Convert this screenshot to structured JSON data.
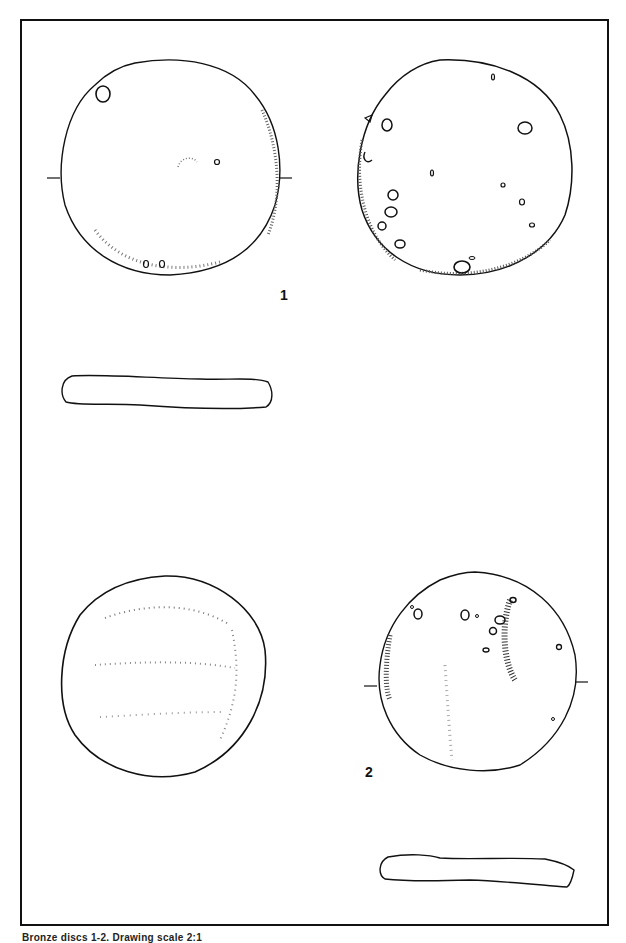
{
  "plate": {
    "figures": [
      {
        "number": "1",
        "views": [
          "obverse",
          "reverse",
          "profile"
        ]
      },
      {
        "number": "2",
        "views": [
          "obverse",
          "reverse",
          "profile"
        ]
      }
    ],
    "labels": {
      "fig1": "1",
      "fig2": "2"
    },
    "caption": "Bronze discs 1-2. Drawing scale 2:1"
  }
}
